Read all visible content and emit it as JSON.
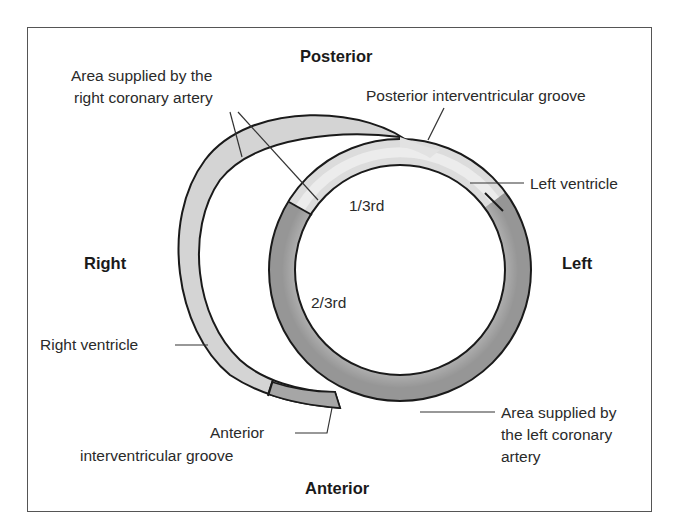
{
  "diagram": {
    "orientation": {
      "top": "Posterior",
      "bottom": "Anterior",
      "left": "Right",
      "right": "Left"
    },
    "labels": {
      "rca_area_line1": "Area supplied by the",
      "rca_area_line2": "right coronary artery",
      "posterior_groove": "Posterior interventricular groove",
      "left_ventricle": "Left ventricle",
      "one_third": "1/3rd",
      "two_third": "2/3rd",
      "right_ventricle": "Right ventricle",
      "anterior_groove_line1": "Anterior",
      "anterior_groove_line2": "interventricular groove",
      "lca_area_line1": "Area supplied by",
      "lca_area_line2": "the left coronary",
      "lca_area_line3": "artery"
    },
    "colors": {
      "rca_region": "#d9d9d9",
      "lca_region": "#a8a8a8",
      "outline": "#1a1a1a",
      "frame": "#555555"
    }
  }
}
